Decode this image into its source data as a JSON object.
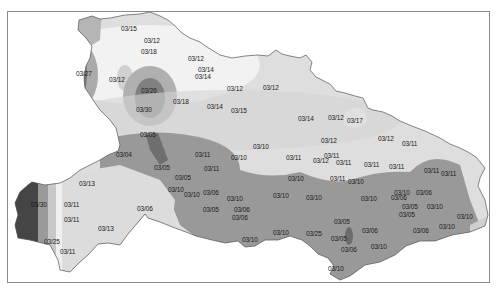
{
  "map": {
    "title": "",
    "legend": [],
    "colors": {
      "lightest": "#f0f0f0",
      "light": "#dcdcdc",
      "mid": "#b8b8b8",
      "mid_dark": "#9a9a9a",
      "dark": "#7a7a7a",
      "darkest": "#4a4a4a",
      "frame": "#8a8a8a",
      "boundary": "#555555"
    },
    "labels": [
      {
        "text": "03/15",
        "x": 130,
        "y": 28
      },
      {
        "text": "03/12",
        "x": 153,
        "y": 40
      },
      {
        "text": "03/18",
        "x": 150,
        "y": 51
      },
      {
        "text": "03/27",
        "x": 85,
        "y": 73
      },
      {
        "text": "03/12",
        "x": 118,
        "y": 79
      },
      {
        "text": "03/12",
        "x": 197,
        "y": 58
      },
      {
        "text": "03/14",
        "x": 207,
        "y": 69
      },
      {
        "text": "03/14",
        "x": 204,
        "y": 76
      },
      {
        "text": "03/26",
        "x": 150,
        "y": 90
      },
      {
        "text": "03/30",
        "x": 145,
        "y": 109
      },
      {
        "text": "03/18",
        "x": 182,
        "y": 101
      },
      {
        "text": "03/14",
        "x": 216,
        "y": 106
      },
      {
        "text": "03/12",
        "x": 236,
        "y": 88
      },
      {
        "text": "03/12",
        "x": 272,
        "y": 87
      },
      {
        "text": "03/15",
        "x": 240,
        "y": 110
      },
      {
        "text": "03/14",
        "x": 307,
        "y": 118
      },
      {
        "text": "03/12",
        "x": 337,
        "y": 117
      },
      {
        "text": "03/17",
        "x": 356,
        "y": 120
      },
      {
        "text": "03/12",
        "x": 330,
        "y": 140
      },
      {
        "text": "03/12",
        "x": 387,
        "y": 138
      },
      {
        "text": "03/11",
        "x": 411,
        "y": 143
      },
      {
        "text": "03/05",
        "x": 149,
        "y": 134
      },
      {
        "text": "03/04",
        "x": 125,
        "y": 154
      },
      {
        "text": "03/05",
        "x": 163,
        "y": 167
      },
      {
        "text": "03/11",
        "x": 204,
        "y": 154
      },
      {
        "text": "03/11",
        "x": 213,
        "y": 168
      },
      {
        "text": "03/10",
        "x": 262,
        "y": 146
      },
      {
        "text": "03/10",
        "x": 240,
        "y": 157
      },
      {
        "text": "03/11",
        "x": 295,
        "y": 157
      },
      {
        "text": "03/11",
        "x": 333,
        "y": 155
      },
      {
        "text": "03/12",
        "x": 322,
        "y": 160
      },
      {
        "text": "03/11",
        "x": 345,
        "y": 162
      },
      {
        "text": "03/11",
        "x": 373,
        "y": 164
      },
      {
        "text": "03/11",
        "x": 398,
        "y": 166
      },
      {
        "text": "03/11",
        "x": 433,
        "y": 170
      },
      {
        "text": "03/11",
        "x": 450,
        "y": 173
      },
      {
        "text": "03/05",
        "x": 184,
        "y": 177
      },
      {
        "text": "03/13",
        "x": 88,
        "y": 183
      },
      {
        "text": "03/10",
        "x": 177,
        "y": 189
      },
      {
        "text": "03/10",
        "x": 193,
        "y": 194
      },
      {
        "text": "03/06",
        "x": 212,
        "y": 192
      },
      {
        "text": "03/10",
        "x": 236,
        "y": 198
      },
      {
        "text": "03/06",
        "x": 243,
        "y": 209
      },
      {
        "text": "03/10",
        "x": 297,
        "y": 178
      },
      {
        "text": "03/11",
        "x": 339,
        "y": 178
      },
      {
        "text": "03/10",
        "x": 357,
        "y": 181
      },
      {
        "text": "03/10",
        "x": 282,
        "y": 195
      },
      {
        "text": "03/10",
        "x": 315,
        "y": 197
      },
      {
        "text": "03/10",
        "x": 370,
        "y": 198
      },
      {
        "text": "03/10",
        "x": 403,
        "y": 192
      },
      {
        "text": "03/06",
        "x": 400,
        "y": 197
      },
      {
        "text": "03/06",
        "x": 425,
        "y": 192
      },
      {
        "text": "03/05",
        "x": 411,
        "y": 206
      },
      {
        "text": "03/05",
        "x": 408,
        "y": 214
      },
      {
        "text": "03/10",
        "x": 436,
        "y": 206
      },
      {
        "text": "03/10",
        "x": 466,
        "y": 216
      },
      {
        "text": "03/30",
        "x": 40,
        "y": 204
      },
      {
        "text": "03/11",
        "x": 73,
        "y": 204
      },
      {
        "text": "03/11",
        "x": 73,
        "y": 219
      },
      {
        "text": "03/06",
        "x": 146,
        "y": 208
      },
      {
        "text": "03/05",
        "x": 212,
        "y": 209
      },
      {
        "text": "03/06",
        "x": 241,
        "y": 217
      },
      {
        "text": "03/13",
        "x": 107,
        "y": 228
      },
      {
        "text": "03/25",
        "x": 53,
        "y": 241
      },
      {
        "text": "03/11",
        "x": 69,
        "y": 251
      },
      {
        "text": "03/05",
        "x": 343,
        "y": 221
      },
      {
        "text": "03/06",
        "x": 371,
        "y": 230
      },
      {
        "text": "03/05",
        "x": 340,
        "y": 238
      },
      {
        "text": "03/06",
        "x": 350,
        "y": 249
      },
      {
        "text": "03/10",
        "x": 380,
        "y": 246
      },
      {
        "text": "03/06",
        "x": 422,
        "y": 230
      },
      {
        "text": "03/10",
        "x": 448,
        "y": 226
      },
      {
        "text": "03/10",
        "x": 282,
        "y": 232
      },
      {
        "text": "03/25",
        "x": 315,
        "y": 233
      },
      {
        "text": "03/10",
        "x": 251,
        "y": 239
      },
      {
        "text": "03/10",
        "x": 337,
        "y": 268
      }
    ]
  }
}
